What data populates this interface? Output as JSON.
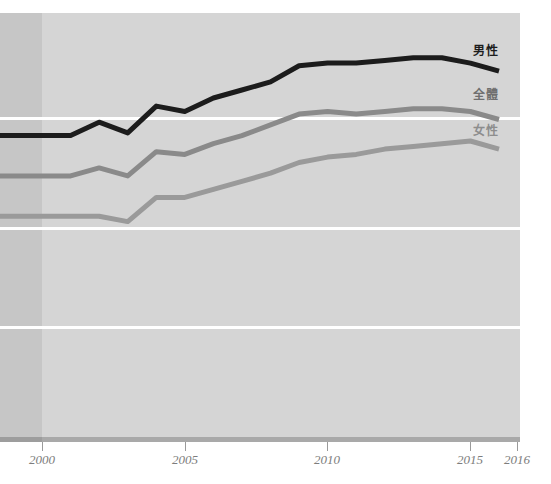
{
  "title": "",
  "legend": {
    "male_label": "男性",
    "total_label": "全體",
    "female_label": "女性"
  },
  "axis": {
    "tick_labels": [
      "2000",
      "2005",
      "2010",
      "2015",
      "2016"
    ]
  },
  "colors": {
    "male_line": "#1c1c1c",
    "total_line": "#8a8a8a",
    "female_line": "#9a9a9a",
    "plot_background": "#d5d5d5",
    "plot_background_pre2000": "#c6c6c6",
    "gridline": "#ffffff",
    "axis_bar": "#a9a9a9",
    "tick_label": "#7d7d7d"
  },
  "chart_data": {
    "type": "line",
    "title": "",
    "xlabel": "",
    "ylabel": "",
    "grid": true,
    "legend_position": "right-inline",
    "xlim": [
      2000,
      2016
    ],
    "ylim": [
      0,
      100
    ],
    "x": [
      2000,
      2001,
      2002,
      2003,
      2004,
      2005,
      2006,
      2007,
      2008,
      2009,
      2010,
      2011,
      2012,
      2013,
      2014,
      2015,
      2016
    ],
    "tick_values": [
      2000,
      2005,
      2010,
      2015,
      2016
    ],
    "series": [
      {
        "name": "男性",
        "color": "#1c1c1c",
        "values": [
          73.5,
          73.5,
          76.0,
          74.0,
          79.0,
          78.0,
          80.5,
          82.0,
          83.5,
          86.5,
          87.0,
          87.0,
          87.5,
          88.0,
          88.0,
          87.0,
          85.5
        ]
      },
      {
        "name": "全體",
        "color": "#8a8a8a",
        "values": [
          66.0,
          66.0,
          67.5,
          66.0,
          70.5,
          70.0,
          72.0,
          73.5,
          75.5,
          77.5,
          78.0,
          77.5,
          78.0,
          78.5,
          78.5,
          78.0,
          76.5
        ]
      },
      {
        "name": "女性",
        "color": "#9a9a9a",
        "values": [
          58.5,
          58.5,
          58.5,
          57.5,
          62.0,
          62.0,
          63.5,
          65.0,
          66.5,
          68.5,
          69.5,
          70.0,
          71.0,
          71.5,
          72.0,
          72.5,
          71.0
        ]
      }
    ]
  }
}
